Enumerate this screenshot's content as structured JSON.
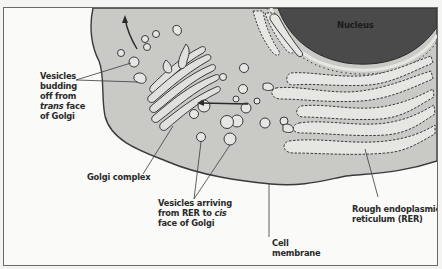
{
  "diagram": {
    "colors": {
      "background": "#fafaf8",
      "cytoplasm": "#c9c9c6",
      "nucleus": "#4a4a4a",
      "cisternae": "#e6e6e2",
      "outline": "#3a3a3a",
      "label_text": "#2a2a2a"
    },
    "nucleus_label": "Nucleus",
    "labels": {
      "vesicles_budding": {
        "line1": "Vesicles",
        "line2": "budding",
        "line3": "off from",
        "line4_italic": "trans",
        "line4_rest": " face",
        "line5": "of Golgi"
      },
      "golgi_complex": "Golgi complex",
      "vesicles_arriving": {
        "line1": "Vesicles arriving",
        "line2_prefix": "from RER to ",
        "line2_italic": "cis",
        "line3": "face of Golgi"
      },
      "cell_membrane": {
        "line1": "Cell",
        "line2": "membrane"
      },
      "rer": {
        "line1": "Rough endoplasmic",
        "line2": "reticulum (RER)"
      }
    }
  }
}
